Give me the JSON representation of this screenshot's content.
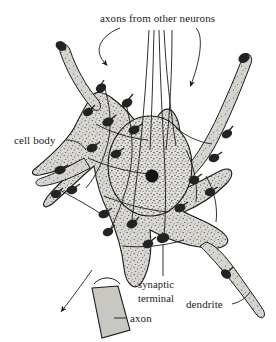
{
  "figure": {
    "subject": "neuron",
    "style": "stippled pen-and-ink biological illustration",
    "background_color": "#ffffff",
    "ink_color": "#1a1a1a",
    "cytoplasm_color": "#d9d7d2",
    "bouton_color": "#2b2b2b",
    "nucleus_color": "#dedcd7"
  },
  "labels": {
    "axons_from_other_neurons": "axons from other neurons",
    "cell_body": "cell body",
    "synaptic_terminal_line1": "synaptic",
    "synaptic_terminal_line2": "terminal",
    "dendrite": "dendrite",
    "axon": "axon"
  },
  "parts": [
    {
      "name": "cell-body",
      "label": "cell body",
      "description": "stippled soma with nucleus and nucleolus"
    },
    {
      "name": "nucleus",
      "label": "",
      "description": "large oval nucleus with dark nucleolus"
    },
    {
      "name": "dendrite",
      "label": "dendrite",
      "count": 4,
      "description": "tapering processes radiating from soma"
    },
    {
      "name": "axon",
      "label": "axon",
      "description": "thick trunk leaving soma at lower left"
    },
    {
      "name": "synaptic-terminal",
      "label": "synaptic terminal",
      "description": "dark teardrop boutons on soma and dendrites"
    },
    {
      "name": "incoming-axons",
      "label": "axons from other neurons",
      "description": "fibers descending from top of figure"
    }
  ],
  "annotations": {
    "arrow_count": 3,
    "arrow_meaning": "direction of incoming axons and outgoing impulse",
    "bouton_count": 22
  }
}
